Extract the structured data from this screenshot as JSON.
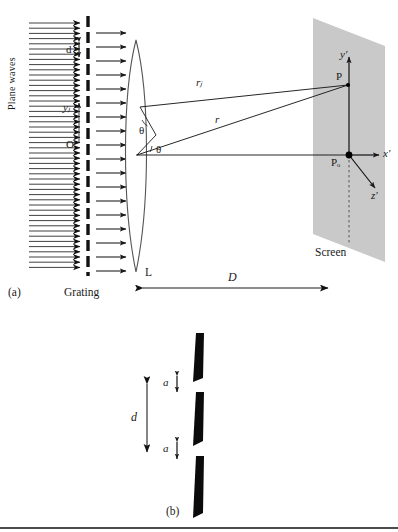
{
  "figure": {
    "type": "optics-diagram",
    "title_parts": [
      "(a)",
      "(b)"
    ],
    "panel_a": {
      "caption": "(a)",
      "labels": {
        "plane_waves": "Plane waves",
        "grating": "Grating",
        "lens": "L",
        "screen": "Screen",
        "distance": "D",
        "slit_spacing": "d",
        "slit_position": "yⱼ",
        "origin": "O",
        "ray_j": "rⱼ",
        "ray": "r",
        "angle_upper": "θ",
        "angle_lower": "θ",
        "point_p": "P",
        "point_p0": "Pₒ",
        "axis_x": "x′",
        "axis_y": "y′",
        "axis_z": "z′"
      },
      "counts": {
        "plane_wave_arrows": 47,
        "grating_dashes": 18,
        "output_arrows": 17
      },
      "colors": {
        "screen_fill": "#c9c9c9",
        "line": "#1a1a1a",
        "ink": "#000000"
      }
    },
    "panel_b": {
      "caption": "(b)",
      "labels": {
        "slit_width_top": "a",
        "slit_width_bottom": "a",
        "period": "d"
      },
      "bars": 3,
      "colors": {
        "bar_fill": "#000000"
      }
    }
  }
}
